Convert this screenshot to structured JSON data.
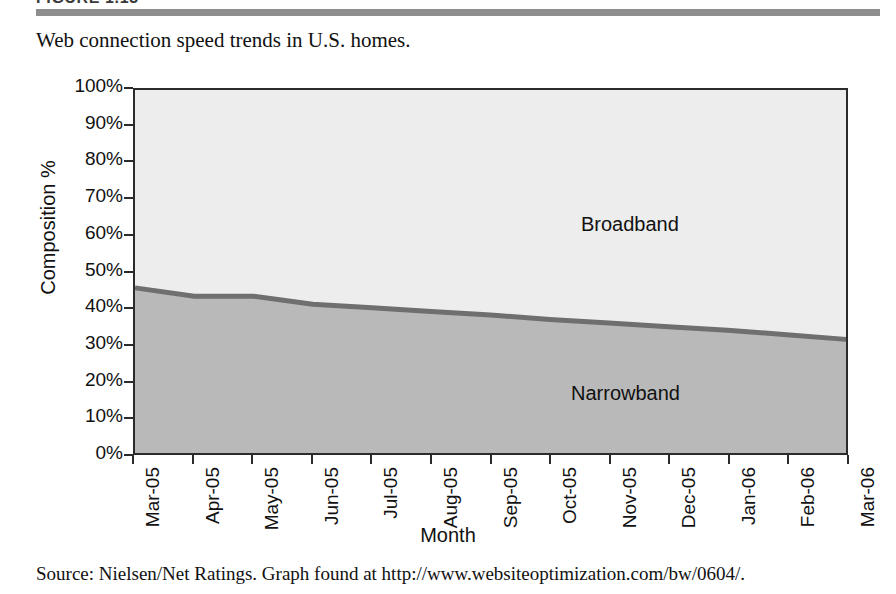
{
  "figure": {
    "number_label": "FIGURE 1.13",
    "caption": "Web connection speed trends in U.S. homes.",
    "rule_color": "#8e8e8e"
  },
  "source": {
    "text": "Source: Nielsen/Net Ratings. Graph found at http://www.websiteoptimization.com/bw/0604/."
  },
  "colors": {
    "broadband_fill": "#ededed",
    "narrowband_fill": "#b9b9b9",
    "boundary_line": "#6f6f6f",
    "axis": "#2b2b2b",
    "text": "#111111"
  },
  "chart_data": {
    "type": "area",
    "title": "",
    "subtitle": "",
    "xlabel": "Month",
    "ylabel": "Composition %",
    "ylim": [
      0,
      100
    ],
    "ytick_labels": [
      "0%",
      "10%",
      "20%",
      "30%",
      "40%",
      "50%",
      "60%",
      "70%",
      "80%",
      "90%",
      "100%"
    ],
    "ytick_values": [
      0,
      10,
      20,
      30,
      40,
      50,
      60,
      70,
      80,
      90,
      100
    ],
    "grid": false,
    "legend_position": "in-plot-annotations",
    "stacked": true,
    "categories": [
      "Mar-05",
      "Apr-05",
      "May-05",
      "Jun-05",
      "Jul-05",
      "Aug-05",
      "Sep-05",
      "Oct-05",
      "Nov-05",
      "Dec-05",
      "Jan-06",
      "Feb-06",
      "Mar-06"
    ],
    "series": [
      {
        "name": "Narrowband",
        "values": [
          45.5,
          43.2,
          43.2,
          41.0,
          40.0,
          39.0,
          38.0,
          36.8,
          35.8,
          34.8,
          33.8,
          32.6,
          31.3
        ]
      },
      {
        "name": "Broadband",
        "values": [
          54.5,
          56.8,
          56.8,
          59.0,
          60.0,
          61.0,
          62.0,
          63.2,
          64.2,
          65.2,
          66.2,
          67.4,
          68.7
        ]
      }
    ],
    "annotations": [
      {
        "text": "Broadband",
        "x_category": "Sep-05",
        "y_value": 66
      },
      {
        "text": "Narrowband",
        "x_category": "Sep-05",
        "y_value": 21
      }
    ]
  }
}
